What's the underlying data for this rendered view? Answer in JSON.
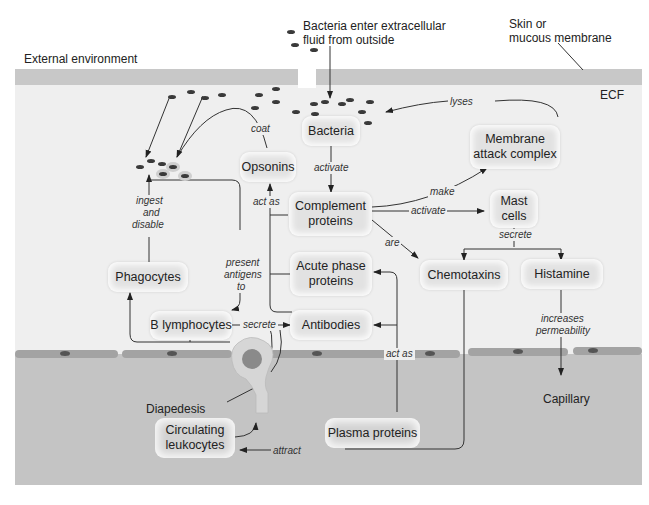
{
  "labels": {
    "external_environment": "External environment",
    "bacteria_enter": "Bacteria enter extracellular\nfluid from outside",
    "bacteria_enter_line1": "Bacteria enter extracellular",
    "bacteria_enter_line2": "fluid from outside",
    "skin_line1": "Skin or",
    "skin_line2": "mucous membrane",
    "ecf": "ECF",
    "diapedesis": "Diapedesis",
    "capillary": "Capillary"
  },
  "nodes": {
    "bacteria": "Bacteria",
    "opsonins": "Opsonins",
    "complement_line1": "Complement",
    "complement_line2": "proteins",
    "mac_line1": "Membrane",
    "mac_line2": "attack complex",
    "mast_line1": "Mast",
    "mast_line2": "cells",
    "chemotaxins": "Chemotaxins",
    "histamine": "Histamine",
    "phagocytes": "Phagocytes",
    "acute_line1": "Acute phase",
    "acute_line2": "proteins",
    "b_lymphocytes": "B lymphocytes",
    "antibodies": "Antibodies",
    "circulating_line1": "Circulating",
    "circulating_line2": "leukocytes",
    "plasma_proteins": "Plasma proteins"
  },
  "edges": {
    "lyses": "lyses",
    "coat": "coat",
    "activate_bacteria": "activate",
    "act_as_opsonins": "act as",
    "make": "make",
    "activate_mast": "activate",
    "are": "are",
    "secrete_mast": "secrete",
    "ingest_line1": "ingest",
    "ingest_line2": "and",
    "ingest_line3": "disable",
    "present_line1": "present",
    "present_line2": "antigens",
    "present_line3": "to",
    "secrete_b": "secrete",
    "act_as_plasma": "act as",
    "increases_line1": "increases",
    "increases_line2": "permeability",
    "attract": "attract"
  },
  "colors": {
    "ecf_bg": "#efefef",
    "skin": "#c8c8c8",
    "capillary": "#c4c4c4",
    "node": "#e2e2e2",
    "line": "#333333"
  }
}
